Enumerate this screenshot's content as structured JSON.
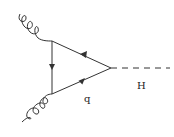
{
  "diagram": {
    "type": "feynman",
    "process": "gluon fusion Higgs production via quark loop",
    "labels": {
      "quark": "q",
      "higgs": "H"
    },
    "vertices": [
      {
        "id": "v_top",
        "x": 52,
        "y": 41
      },
      {
        "id": "v_bottom",
        "x": 52,
        "y": 94
      },
      {
        "id": "v_right",
        "x": 111,
        "y": 68
      }
    ],
    "propagators": [
      {
        "from": "v_top",
        "to": "v_bottom",
        "style": "fermion",
        "arrow": "down"
      },
      {
        "from": "v_bottom",
        "to": "v_right",
        "style": "fermion",
        "arrow": "toward-right"
      },
      {
        "from": "v_right",
        "to": "v_top",
        "style": "fermion",
        "arrow": "toward-left"
      }
    ],
    "external_lines": [
      {
        "particle": "gluon",
        "attached_to": "v_top",
        "style": "curly"
      },
      {
        "particle": "gluon",
        "attached_to": "v_bottom",
        "style": "curly"
      },
      {
        "particle": "higgs",
        "attached_to": "v_right",
        "style": "dashed"
      }
    ],
    "colors": {
      "line": "#333333",
      "background": "#ffffff"
    }
  }
}
